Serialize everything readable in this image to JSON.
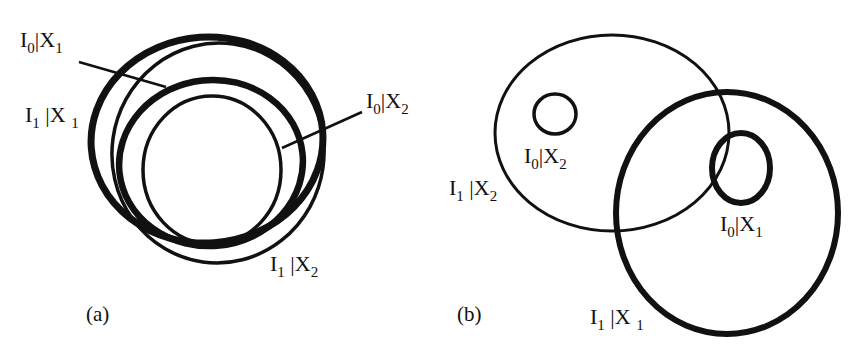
{
  "figure": {
    "panels": [
      {
        "id": "a",
        "caption": "(a)",
        "regions": [
          {
            "name": "I1|X1",
            "I": "I",
            "i_sub": "1",
            "sep": "|",
            "X": "X",
            "x_sub": "1",
            "stroke": "thick"
          },
          {
            "name": "I0|X1",
            "I": "I",
            "i_sub": "0",
            "sep": "|",
            "X": "X",
            "x_sub": "1",
            "stroke": "thick"
          },
          {
            "name": "I0|X2",
            "I": "I",
            "i_sub": "0",
            "sep": "|",
            "X": "X",
            "x_sub": "2",
            "stroke": "thin"
          },
          {
            "name": "I1|X2",
            "I": "I",
            "i_sub": "1",
            "sep": "|",
            "X": "X",
            "x_sub": "2",
            "stroke": "thin"
          }
        ]
      },
      {
        "id": "b",
        "caption": "(b)",
        "regions": [
          {
            "name": "I1|X2",
            "I": "I",
            "i_sub": "1",
            "sep": "|",
            "X": "X",
            "x_sub": "2",
            "stroke": "thin"
          },
          {
            "name": "I0|X2",
            "I": "I",
            "i_sub": "0",
            "sep": "|",
            "X": "X",
            "x_sub": "2",
            "stroke": "thin"
          },
          {
            "name": "I0|X1",
            "I": "I",
            "i_sub": "0",
            "sep": "|",
            "X": "X",
            "x_sub": "1",
            "stroke": "thick"
          },
          {
            "name": "I1|X1",
            "I": "I",
            "i_sub": "1",
            "sep": "|",
            "X": "X",
            "x_sub": "1",
            "stroke": "thick"
          }
        ]
      }
    ],
    "colors": {
      "ink": "#111111",
      "background": "#ffffff"
    }
  }
}
